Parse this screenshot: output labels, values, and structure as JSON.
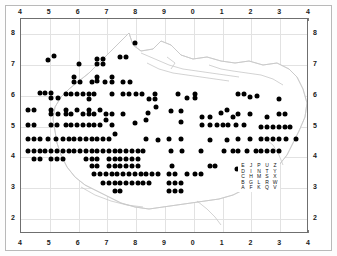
{
  "figure": {
    "type": "distribution-dot-map"
  },
  "axes": {
    "top_ticks": [
      "4",
      "5",
      "6",
      "7",
      "8",
      "9",
      "0",
      "1",
      "2",
      "3",
      "4"
    ],
    "bottom_ticks": [
      "4",
      "5",
      "6",
      "7",
      "8",
      "9",
      "0",
      "1",
      "2",
      "3",
      "4"
    ],
    "left_ticks": [
      "8",
      "7",
      "6",
      "5",
      "4",
      "3",
      "2"
    ],
    "right_ticks": [
      "8",
      "7",
      "6",
      "5",
      "4",
      "3",
      "2"
    ]
  },
  "legend": {
    "name": "grid-letter-key",
    "rows": [
      [
        "E",
        "J",
        "P",
        "U",
        "Z"
      ],
      [
        "D",
        "I",
        "N",
        "T",
        "Y"
      ],
      [
        "C",
        "H",
        "M",
        "S",
        "X"
      ],
      [
        "B",
        "G",
        "L",
        "R",
        "W"
      ],
      [
        "A",
        "F",
        "K",
        "Q",
        "V"
      ]
    ]
  },
  "colors": {
    "dot": "#000000",
    "grid": "#e2e2e2",
    "coastline": "#c8c8c8",
    "frame": "#6f6f6f",
    "outer_frame": "#b9b9b9",
    "background": "#ffffff",
    "label": "#1a1a1a"
  },
  "chart_data": {
    "type": "scatter",
    "title": "",
    "xlabel": "",
    "ylabel": "",
    "xlim": [
      4,
      14
    ],
    "ylim": [
      1.5,
      8.5
    ],
    "grid": true,
    "legend_position": "inside-bottom-right",
    "xtick_labels": [
      "4",
      "5",
      "6",
      "7",
      "8",
      "9",
      "0",
      "1",
      "2",
      "3",
      "4"
    ],
    "ytick_labels": [
      "8",
      "7",
      "6",
      "5",
      "4",
      "3",
      "2"
    ],
    "marker": "filled-circle",
    "point_count": 373,
    "points": [
      [
        7.95,
        7.72
      ],
      [
        4.95,
        7.15
      ],
      [
        5.15,
        7.28
      ],
      [
        6.0,
        7.05
      ],
      [
        6.65,
        7.2
      ],
      [
        6.65,
        7.05
      ],
      [
        6.85,
        7.05
      ],
      [
        6.85,
        7.2
      ],
      [
        7.45,
        7.27
      ],
      [
        7.65,
        7.27
      ],
      [
        5.85,
        6.6
      ],
      [
        5.85,
        6.45
      ],
      [
        6.05,
        6.45
      ],
      [
        6.45,
        6.45
      ],
      [
        6.65,
        6.47
      ],
      [
        6.65,
        6.62
      ],
      [
        6.9,
        6.45
      ],
      [
        7.15,
        6.6
      ],
      [
        7.15,
        6.45
      ],
      [
        7.55,
        6.45
      ],
      [
        7.8,
        6.45
      ],
      [
        4.65,
        6.08
      ],
      [
        4.85,
        6.08
      ],
      [
        5.05,
        6.08
      ],
      [
        5.05,
        5.92
      ],
      [
        5.3,
        5.92
      ],
      [
        5.55,
        6.05
      ],
      [
        5.75,
        6.05
      ],
      [
        5.95,
        6.07
      ],
      [
        6.15,
        6.07
      ],
      [
        6.35,
        6.05
      ],
      [
        6.55,
        6.05
      ],
      [
        6.35,
        5.9
      ],
      [
        7.15,
        6.05
      ],
      [
        7.55,
        6.05
      ],
      [
        7.75,
        6.05
      ],
      [
        8.0,
        6.05
      ],
      [
        8.2,
        6.05
      ],
      [
        8.45,
        5.9
      ],
      [
        8.65,
        5.9
      ],
      [
        8.65,
        6.05
      ],
      [
        9.45,
        6.05
      ],
      [
        9.75,
        5.92
      ],
      [
        10.05,
        5.92
      ],
      [
        10.05,
        6.05
      ],
      [
        11.55,
        6.05
      ],
      [
        11.75,
        6.05
      ],
      [
        11.95,
        5.95
      ],
      [
        12.2,
        6.0
      ],
      [
        12.95,
        5.9
      ],
      [
        4.25,
        5.55
      ],
      [
        4.45,
        5.55
      ],
      [
        5.05,
        5.55
      ],
      [
        5.05,
        5.4
      ],
      [
        5.3,
        5.4
      ],
      [
        5.55,
        5.55
      ],
      [
        5.55,
        5.4
      ],
      [
        5.75,
        5.4
      ],
      [
        5.95,
        5.55
      ],
      [
        6.15,
        5.4
      ],
      [
        6.35,
        5.55
      ],
      [
        6.35,
        5.4
      ],
      [
        6.55,
        5.4
      ],
      [
        6.75,
        5.55
      ],
      [
        6.95,
        5.4
      ],
      [
        7.15,
        5.4
      ],
      [
        7.55,
        5.4
      ],
      [
        8.4,
        5.45
      ],
      [
        8.7,
        5.62
      ],
      [
        9.2,
        5.5
      ],
      [
        9.55,
        5.5
      ],
      [
        10.3,
        5.3
      ],
      [
        10.55,
        5.3
      ],
      [
        10.95,
        5.45
      ],
      [
        11.15,
        5.55
      ],
      [
        11.35,
        5.3
      ],
      [
        11.55,
        5.4
      ],
      [
        11.95,
        5.4
      ],
      [
        12.55,
        5.3
      ],
      [
        12.95,
        5.4
      ],
      [
        13.15,
        5.4
      ],
      [
        4.25,
        5.05
      ],
      [
        4.45,
        5.05
      ],
      [
        5.05,
        5.05
      ],
      [
        5.25,
        5.05
      ],
      [
        5.55,
        5.05
      ],
      [
        5.75,
        5.05
      ],
      [
        5.95,
        5.05
      ],
      [
        6.15,
        5.05
      ],
      [
        6.35,
        5.05
      ],
      [
        6.55,
        5.05
      ],
      [
        6.75,
        5.05
      ],
      [
        6.95,
        5.2
      ],
      [
        7.15,
        5.05
      ],
      [
        7.95,
        5.1
      ],
      [
        8.35,
        5.2
      ],
      [
        9.55,
        5.15
      ],
      [
        10.3,
        5.05
      ],
      [
        10.55,
        5.05
      ],
      [
        10.8,
        5.05
      ],
      [
        11.0,
        5.05
      ],
      [
        11.2,
        5.05
      ],
      [
        11.45,
        5.05
      ],
      [
        11.75,
        5.05
      ],
      [
        12.35,
        5.0
      ],
      [
        12.55,
        5.0
      ],
      [
        12.75,
        5.0
      ],
      [
        12.95,
        5.0
      ],
      [
        13.15,
        5.0
      ],
      [
        13.35,
        5.0
      ],
      [
        4.25,
        4.6
      ],
      [
        4.45,
        4.6
      ],
      [
        4.65,
        4.6
      ],
      [
        4.95,
        4.6
      ],
      [
        5.2,
        4.6
      ],
      [
        5.45,
        4.6
      ],
      [
        5.65,
        4.6
      ],
      [
        5.85,
        4.6
      ],
      [
        6.05,
        4.6
      ],
      [
        6.25,
        4.6
      ],
      [
        6.45,
        4.6
      ],
      [
        6.65,
        4.6
      ],
      [
        6.85,
        4.6
      ],
      [
        7.05,
        4.6
      ],
      [
        7.25,
        4.75
      ],
      [
        8.35,
        4.6
      ],
      [
        8.75,
        4.55
      ],
      [
        9.15,
        4.6
      ],
      [
        9.55,
        4.6
      ],
      [
        10.55,
        4.55
      ],
      [
        11.15,
        4.55
      ],
      [
        11.55,
        4.6
      ],
      [
        11.95,
        4.6
      ],
      [
        12.35,
        4.6
      ],
      [
        12.55,
        4.6
      ],
      [
        12.75,
        4.6
      ],
      [
        12.95,
        4.6
      ],
      [
        13.2,
        4.6
      ],
      [
        13.55,
        4.58
      ],
      [
        4.25,
        4.2
      ],
      [
        4.45,
        4.2
      ],
      [
        4.65,
        4.2
      ],
      [
        4.85,
        4.2
      ],
      [
        5.05,
        4.2
      ],
      [
        5.25,
        4.2
      ],
      [
        5.45,
        4.2
      ],
      [
        5.65,
        4.2
      ],
      [
        5.85,
        4.2
      ],
      [
        6.05,
        4.2
      ],
      [
        6.25,
        4.2
      ],
      [
        6.45,
        4.2
      ],
      [
        6.65,
        4.2
      ],
      [
        6.85,
        4.2
      ],
      [
        7.05,
        4.2
      ],
      [
        7.25,
        4.2
      ],
      [
        7.45,
        4.2
      ],
      [
        7.65,
        4.2
      ],
      [
        7.85,
        4.2
      ],
      [
        8.05,
        4.2
      ],
      [
        8.25,
        4.2
      ],
      [
        9.2,
        4.2
      ],
      [
        9.6,
        4.2
      ],
      [
        10.25,
        4.2
      ],
      [
        11.05,
        4.2
      ],
      [
        11.35,
        4.2
      ],
      [
        11.55,
        4.2
      ],
      [
        11.85,
        4.2
      ],
      [
        12.15,
        4.2
      ],
      [
        12.35,
        4.2
      ],
      [
        12.55,
        4.2
      ],
      [
        12.75,
        4.2
      ],
      [
        12.95,
        4.2
      ],
      [
        4.45,
        3.95
      ],
      [
        4.65,
        3.95
      ],
      [
        5.05,
        3.95
      ],
      [
        5.25,
        3.95
      ],
      [
        5.45,
        3.95
      ],
      [
        6.25,
        3.95
      ],
      [
        6.45,
        3.95
      ],
      [
        6.65,
        3.95
      ],
      [
        7.05,
        3.95
      ],
      [
        7.25,
        3.95
      ],
      [
        7.45,
        3.95
      ],
      [
        7.65,
        3.95
      ],
      [
        7.85,
        3.95
      ],
      [
        8.05,
        3.95
      ],
      [
        6.45,
        3.7
      ],
      [
        6.65,
        3.7
      ],
      [
        7.05,
        3.7
      ],
      [
        7.25,
        3.7
      ],
      [
        7.45,
        3.7
      ],
      [
        7.65,
        3.7
      ],
      [
        7.85,
        3.7
      ],
      [
        8.05,
        3.7
      ],
      [
        9.25,
        3.7
      ],
      [
        10.55,
        3.7
      ],
      [
        10.75,
        3.7
      ],
      [
        11.5,
        3.62
      ],
      [
        12.25,
        3.62
      ],
      [
        6.55,
        3.45
      ],
      [
        6.75,
        3.45
      ],
      [
        6.95,
        3.45
      ],
      [
        7.15,
        3.45
      ],
      [
        7.35,
        3.45
      ],
      [
        7.55,
        3.45
      ],
      [
        7.75,
        3.45
      ],
      [
        7.95,
        3.45
      ],
      [
        8.15,
        3.45
      ],
      [
        8.35,
        3.45
      ],
      [
        8.55,
        3.45
      ],
      [
        8.75,
        3.45
      ],
      [
        9.15,
        3.45
      ],
      [
        9.35,
        3.45
      ],
      [
        9.75,
        3.45
      ],
      [
        10.05,
        3.45
      ],
      [
        10.25,
        3.45
      ],
      [
        6.85,
        3.15
      ],
      [
        7.05,
        3.15
      ],
      [
        7.25,
        3.15
      ],
      [
        7.45,
        3.15
      ],
      [
        7.65,
        3.15
      ],
      [
        7.85,
        3.15
      ],
      [
        8.05,
        3.15
      ],
      [
        8.25,
        3.15
      ],
      [
        8.45,
        3.15
      ],
      [
        9.15,
        3.15
      ],
      [
        9.35,
        3.15
      ],
      [
        9.55,
        3.15
      ],
      [
        7.25,
        2.9
      ],
      [
        7.45,
        2.9
      ],
      [
        9.15,
        2.9
      ],
      [
        9.35,
        2.9
      ],
      [
        9.55,
        2.9
      ]
    ]
  }
}
